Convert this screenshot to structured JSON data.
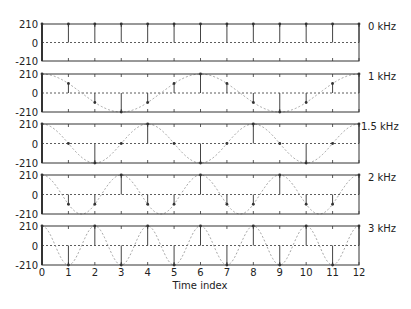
{
  "chart_data": {
    "type": "stem",
    "title": "",
    "xlabel": "Time index",
    "ylabel": "",
    "x": [
      0,
      1,
      2,
      3,
      4,
      5,
      6,
      7,
      8,
      9,
      10,
      11,
      12
    ],
    "xlim": [
      0,
      12
    ],
    "ylim": [
      -210,
      210
    ],
    "yticks": [
      "210",
      "0",
      "-210"
    ],
    "xticks": [
      "0",
      "1",
      "2",
      "3",
      "4",
      "5",
      "6",
      "7",
      "8",
      "9",
      "10",
      "11",
      "12"
    ],
    "sampling_rate_hz": 6000,
    "amplitude": 210,
    "series": [
      {
        "name": "0 kHz",
        "freq_khz": 0,
        "values": [
          210,
          210,
          210,
          210,
          210,
          210,
          210,
          210,
          210,
          210,
          210,
          210,
          210
        ]
      },
      {
        "name": "1 kHz",
        "freq_khz": 1,
        "values": [
          210,
          105,
          -105,
          -210,
          -105,
          105,
          210,
          105,
          -105,
          -210,
          -105,
          105,
          210
        ]
      },
      {
        "name": "1.5 kHz",
        "freq_khz": 1.5,
        "values": [
          210,
          0,
          -210,
          0,
          210,
          0,
          -210,
          0,
          210,
          0,
          -210,
          0,
          210
        ]
      },
      {
        "name": "2 kHz",
        "freq_khz": 2,
        "values": [
          210,
          -105,
          -105,
          210,
          -105,
          -105,
          210,
          -105,
          -105,
          210,
          -105,
          -105,
          210
        ]
      },
      {
        "name": "3 kHz",
        "freq_khz": 3,
        "values": [
          210,
          -210,
          210,
          -210,
          210,
          -210,
          210,
          -210,
          210,
          -210,
          210,
          -210,
          210
        ]
      }
    ],
    "grid": false,
    "legend_position": "right-of-each-panel"
  }
}
